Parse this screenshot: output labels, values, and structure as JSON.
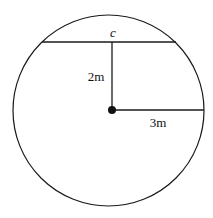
{
  "diagram": {
    "type": "circle-geometry",
    "labels": {
      "chord": "c",
      "distance": "2m",
      "radius": "3m"
    },
    "colors": {
      "stroke": "#1a1a1a",
      "background": "#ffffff"
    }
  }
}
